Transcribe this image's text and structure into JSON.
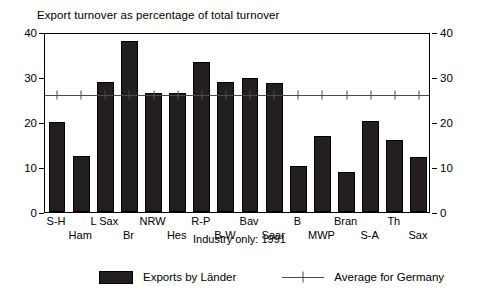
{
  "chart_data": {
    "type": "bar",
    "title": "Export turnover as percentage of total turnover",
    "footnote": "Industry only: 1991",
    "xlabel": "",
    "ylabel": "",
    "ylim": [
      0,
      40
    ],
    "yticks": [
      0,
      10,
      20,
      30,
      40
    ],
    "ytick_labels_left": [
      "0",
      "10",
      "20",
      "30",
      "40"
    ],
    "ytick_labels_right": [
      "0",
      "10",
      "20",
      "30",
      "40"
    ],
    "grid": false,
    "legend_position": "bottom",
    "categories": [
      "S-H",
      "Ham",
      "L Sax",
      "Br",
      "NRW",
      "Hes",
      "R-P",
      "B-W",
      "Bav",
      "Saar",
      "B",
      "MWP",
      "Bran",
      "S-A",
      "Th",
      "Sax"
    ],
    "series": [
      {
        "name": "Exports by Länder",
        "type": "bar",
        "color": "#231f20",
        "values": [
          20.1,
          12.5,
          28.8,
          38.0,
          26.5,
          26.5,
          33.4,
          28.8,
          29.7,
          28.7,
          10.3,
          17.0,
          8.8,
          20.3,
          16.0,
          12.3
        ]
      },
      {
        "name": "Average for Germany",
        "type": "line",
        "color": "#4a4a4a",
        "value": 26.5,
        "values": [
          26.5,
          26.5,
          26.5,
          26.5,
          26.5,
          26.5,
          26.5,
          26.5,
          26.5,
          26.5,
          26.5,
          26.5,
          26.5,
          26.5,
          26.5,
          26.5
        ]
      }
    ],
    "legend": [
      "Exports by Länder",
      "Average for Germany"
    ]
  },
  "legend": {
    "bars_label": "Exports by Länder",
    "line_label": "Average for Germany"
  }
}
